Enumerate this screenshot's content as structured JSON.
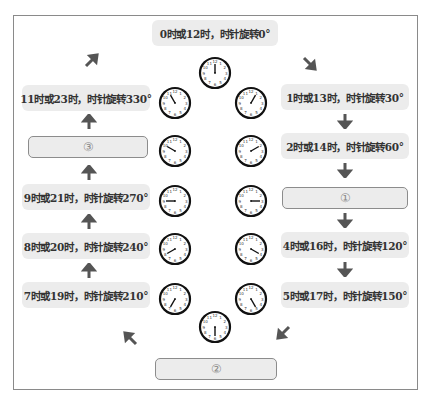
{
  "diagram": {
    "labels": {
      "h0": "0时或12时，时针旋转0°",
      "h1": "1时或13时，时针旋转30°",
      "h2": "2时或14时，时针旋转60°",
      "h4": "4时或16时，时针旋转120°",
      "h5": "5时或17时，时针旋转150°",
      "h7": "7时或19时，时针旋转210°",
      "h8": "8时或20时，时针旋转240°",
      "h9": "9时或21时，时针旋转270°",
      "h11": "11时或23时，时针旋转330°"
    },
    "blanks": {
      "b1": "①",
      "b2": "②",
      "b3": "③"
    },
    "clocks": [
      {
        "hour": 0,
        "angle": 0
      },
      {
        "hour": 1,
        "angle": 30
      },
      {
        "hour": 2,
        "angle": 60
      },
      {
        "hour": 3,
        "angle": 90
      },
      {
        "hour": 4,
        "angle": 120
      },
      {
        "hour": 5,
        "angle": 150
      },
      {
        "hour": 6,
        "angle": 180
      },
      {
        "hour": 7,
        "angle": 210
      },
      {
        "hour": 8,
        "angle": 240
      },
      {
        "hour": 9,
        "angle": 270
      },
      {
        "hour": 10,
        "angle": 300
      },
      {
        "hour": 11,
        "angle": 330
      }
    ],
    "colors": {
      "label_bg": "#ececec",
      "border": "#8a8a8a",
      "arrow": "#555555",
      "text": "#333333"
    }
  }
}
